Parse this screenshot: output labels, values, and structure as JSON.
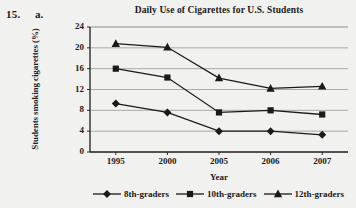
{
  "exercise": {
    "number": "15.",
    "part": "a."
  },
  "chart_data": {
    "type": "line",
    "title": "Daily Use of Cigarettes for U.S. Students",
    "xlabel": "Year",
    "ylabel": "Students smoking cigarettes (%)",
    "categories": [
      "1995",
      "2000",
      "2005",
      "2006",
      "2007"
    ],
    "ylim": [
      0,
      24
    ],
    "yticks": [
      "0",
      "4",
      "8",
      "12",
      "16",
      "20",
      "24"
    ],
    "grid": "horizontal",
    "legend_position": "bottom",
    "series": [
      {
        "name": "8th-graders",
        "marker": "diamond",
        "color": "#1a1a1a",
        "values": [
          9.3,
          7.6,
          4.0,
          4.0,
          3.3
        ]
      },
      {
        "name": "10th-graders",
        "marker": "square",
        "color": "#1a1a1a",
        "values": [
          16.0,
          14.3,
          7.6,
          8.0,
          7.2
        ]
      },
      {
        "name": "12th-graders",
        "marker": "triangle",
        "color": "#1a1a1a",
        "values": [
          20.8,
          20.1,
          14.2,
          12.2,
          12.6
        ]
      }
    ]
  }
}
